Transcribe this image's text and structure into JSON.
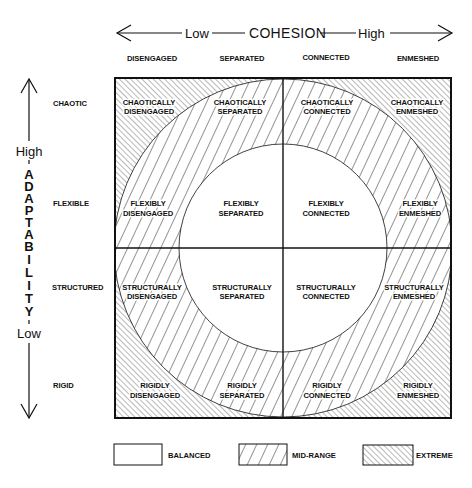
{
  "cohesion_axis": {
    "low": "Low",
    "title": "COHESION",
    "high": "High"
  },
  "cohesion_levels": [
    "DISENGAGED",
    "SEPARATED",
    "CONNECTED",
    "ENMESHED"
  ],
  "adaptability_axis": {
    "high": "High",
    "title": "ADAPTABILITY",
    "letters": [
      "A",
      "D",
      "A",
      "P",
      "T",
      "A",
      "B",
      "I",
      "L",
      "I",
      "T",
      "Y"
    ],
    "low": "Low"
  },
  "adaptability_levels": [
    "CHAOTIC",
    "FLEXIBLE",
    "STRUCTURED",
    "RIGID"
  ],
  "cells": [
    [
      {
        "line1": "CHAOTICALLY",
        "line2": "DISENGAGED",
        "type": "extreme"
      },
      {
        "line1": "CHAOTICALLY",
        "line2": "SEPARATED",
        "type": "mid-range"
      },
      {
        "line1": "CHAOTICALLY",
        "line2": "CONNECTED",
        "type": "mid-range"
      },
      {
        "line1": "CHAOTICALLY",
        "line2": "ENMESHED",
        "type": "extreme"
      }
    ],
    [
      {
        "line1": "FLEXIBLY",
        "line2": "DISENGAGED",
        "type": "mid-range"
      },
      {
        "line1": "FLEXIBLY",
        "line2": "SEPARATED",
        "type": "balanced"
      },
      {
        "line1": "FLEXIBLY",
        "line2": "CONNECTED",
        "type": "balanced"
      },
      {
        "line1": "FLEXIBLY",
        "line2": "ENMESHED",
        "type": "mid-range"
      }
    ],
    [
      {
        "line1": "STRUCTURALLY",
        "line2": "DISENGAGED",
        "type": "mid-range"
      },
      {
        "line1": "STRUCTURALLY",
        "line2": "SEPARATED",
        "type": "balanced"
      },
      {
        "line1": "STRUCTURALLY",
        "line2": "CONNECTED",
        "type": "balanced"
      },
      {
        "line1": "STRUCTURALLY",
        "line2": "ENMESHED",
        "type": "mid-range"
      }
    ],
    [
      {
        "line1": "RIGIDLY",
        "line2": "DISENGAGED",
        "type": "extreme"
      },
      {
        "line1": "RIGIDLY",
        "line2": "SEPARATED",
        "type": "mid-range"
      },
      {
        "line1": "RIGIDLY",
        "line2": "CONNECTED",
        "type": "mid-range"
      },
      {
        "line1": "RIGIDLY",
        "line2": "ENMESHED",
        "type": "extreme"
      }
    ]
  ],
  "legend": [
    {
      "label": "BALANCED",
      "pattern": "none"
    },
    {
      "label": "MID-RANGE",
      "pattern": "wide-forward-hatch"
    },
    {
      "label": "EXTREME",
      "pattern": "dense-back-hatch"
    }
  ],
  "colors": {
    "ink": "#111111",
    "paper": "#ffffff"
  }
}
